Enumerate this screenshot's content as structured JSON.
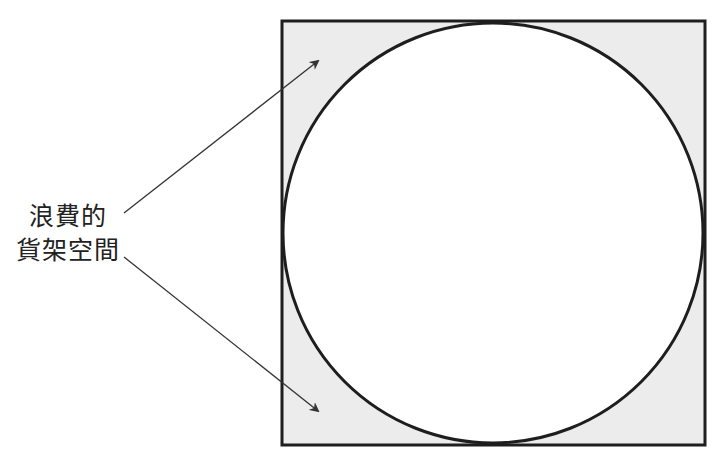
{
  "diagram": {
    "type": "circle-in-square",
    "label_lines": [
      "浪費的",
      "貨架空間"
    ],
    "colors": {
      "background": "#ffffff",
      "waste_fill": "#ececec",
      "circle_fill": "#ffffff",
      "stroke": "#1e1e1e",
      "arrow": "#333333",
      "text": "#222222"
    },
    "square": {
      "x": 282,
      "y": 21,
      "size": 423
    },
    "circle": {
      "cx": 493,
      "cy": 233,
      "r": 209
    },
    "arrows": [
      {
        "from": [
          124,
          213
        ],
        "to": [
          318,
          61
        ]
      },
      {
        "from": [
          124,
          257
        ],
        "to": [
          318,
          411
        ]
      }
    ]
  }
}
